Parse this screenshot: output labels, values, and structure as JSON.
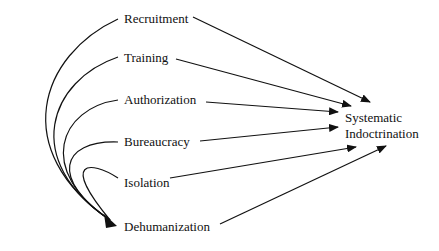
{
  "diagram": {
    "type": "flow-diagram",
    "sources": [
      {
        "id": "recruitment",
        "label": "Recruitment"
      },
      {
        "id": "training",
        "label": "Training"
      },
      {
        "id": "authorization",
        "label": "Authorization"
      },
      {
        "id": "bureaucracy",
        "label": "Bureaucracy"
      },
      {
        "id": "isolation",
        "label": "Isolation"
      },
      {
        "id": "dehumanization",
        "label": "Dehumanization"
      }
    ],
    "target": {
      "id": "systematic-indoctrination",
      "line1": "Systematic",
      "line2": "Indoctrination"
    },
    "edges": [
      {
        "from": "recruitment",
        "to": "systematic-indoctrination"
      },
      {
        "from": "training",
        "to": "systematic-indoctrination"
      },
      {
        "from": "authorization",
        "to": "systematic-indoctrination"
      },
      {
        "from": "bureaucracy",
        "to": "systematic-indoctrination"
      },
      {
        "from": "isolation",
        "to": "systematic-indoctrination"
      },
      {
        "from": "dehumanization",
        "to": "systematic-indoctrination"
      },
      {
        "from": "recruitment",
        "to": "dehumanization"
      },
      {
        "from": "training",
        "to": "dehumanization"
      },
      {
        "from": "authorization",
        "to": "dehumanization"
      },
      {
        "from": "bureaucracy",
        "to": "dehumanization"
      },
      {
        "from": "isolation",
        "to": "dehumanization"
      }
    ],
    "colors": {
      "stroke": "#111111",
      "background": "#ffffff"
    }
  }
}
